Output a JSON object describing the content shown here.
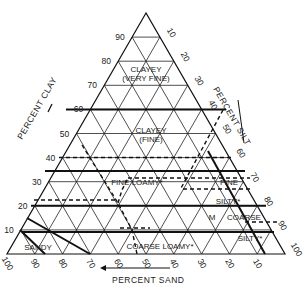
{
  "triangle": {
    "apex": [
      146,
      13
    ],
    "left": [
      7,
      254
    ],
    "right": [
      285,
      254
    ]
  },
  "axes": {
    "clay": {
      "title": "PERCENT CLAY",
      "ticks": [
        "10",
        "20",
        "30",
        "40",
        "50",
        "60",
        "70",
        "80",
        "90"
      ]
    },
    "silt": {
      "title": "PERCENT SILT",
      "ticks": [
        "10",
        "20",
        "30",
        "40",
        "50",
        "60",
        "70",
        "80",
        "90",
        "100"
      ]
    },
    "sand": {
      "title": "PERCENT SAND",
      "ticks": [
        "100",
        "90",
        "80",
        "70",
        "60",
        "50",
        "40",
        "30",
        "20",
        "10"
      ]
    }
  },
  "regions": [
    {
      "id": "clayey-very-fine",
      "lines": [
        "CLAYEY",
        "(VERY FINE)"
      ]
    },
    {
      "id": "clayey-fine",
      "lines": [
        "CLAYEY",
        "(FINE)"
      ]
    },
    {
      "id": "fine-loamy",
      "lines": [
        "FINE LOAMY*"
      ]
    },
    {
      "id": "fine-silty",
      "lines": [
        "FINE"
      ]
    },
    {
      "id": "silty",
      "lines": [
        "SILTY*"
      ]
    },
    {
      "id": "m",
      "lines": [
        "M"
      ]
    },
    {
      "id": "coarse",
      "lines": [
        "COARSE"
      ]
    },
    {
      "id": "coarse-silty",
      "lines": [
        "SILTY*"
      ]
    },
    {
      "id": "coarse-loamy",
      "lines": [
        "COARSE LOAMY*"
      ]
    },
    {
      "id": "sandy",
      "lines": [
        "SANDY"
      ]
    }
  ]
}
